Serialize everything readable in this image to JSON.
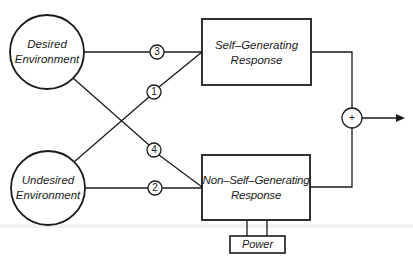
{
  "diagram": {
    "nodes": {
      "desired": {
        "line1": "Desired",
        "line2": "Environment"
      },
      "undesired": {
        "line1": "Undesired",
        "line2": "Environment"
      },
      "self_generating": {
        "line1": "Self–Generating",
        "line2": "Response"
      },
      "non_self_generating": {
        "line1": "Non–Self–Generating",
        "line2": "Response"
      },
      "power": {
        "label": "Power"
      },
      "sum": {
        "label": "+"
      }
    },
    "paths": [
      {
        "id": "1",
        "from": "Undesired Environment",
        "to": "Self-Generating Response"
      },
      {
        "id": "2",
        "from": "Undesired Environment",
        "to": "Non-Self-Generating Response"
      },
      {
        "id": "3",
        "from": "Desired Environment",
        "to": "Self-Generating Response"
      },
      {
        "id": "4",
        "from": "Desired Environment",
        "to": "Non-Self-Generating Response"
      }
    ],
    "colors": {
      "line": "#1a1a1a",
      "background": "#ffffff"
    }
  }
}
